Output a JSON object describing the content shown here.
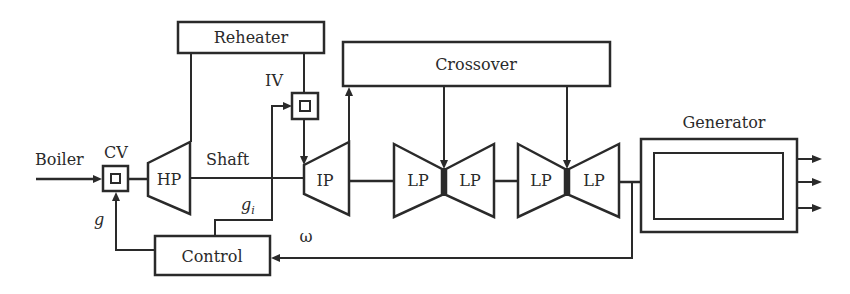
{
  "diagram": {
    "blocks": {
      "reheater": "Reheater",
      "crossover": "Crossover",
      "generator": "Generator",
      "control": "Control"
    },
    "turbines": {
      "hp": "HP",
      "ip": "IP",
      "lp1_left": "LP",
      "lp1_right": "LP",
      "lp2_left": "LP",
      "lp2_right": "LP"
    },
    "valves": {
      "cv": "CV",
      "iv": "IV"
    },
    "labels": {
      "boiler": "Boiler",
      "shaft": "Shaft",
      "g": "g",
      "gi_base": "g",
      "gi_sub": "i",
      "omega": "ω"
    },
    "colors": {
      "stroke": "#2a2a2a",
      "background": "#ffffff"
    }
  }
}
